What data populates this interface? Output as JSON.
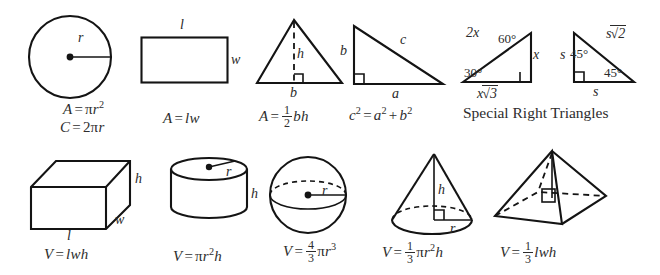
{
  "sheet": {
    "title": "Geometry Formula Reference",
    "row1": {
      "circle": {
        "name": "circle",
        "labels": {
          "radius": "r"
        },
        "formulas": {
          "area_lhs": "A",
          "area_eq": "=",
          "area_pi": "π",
          "area_var": "r",
          "area_exp": "2",
          "circ_lhs": "C",
          "circ_eq": "=",
          "circ_coef": "2",
          "circ_pi": "π",
          "circ_var": "r"
        },
        "area_text": "A = πr²",
        "circumference_text": "C = 2πr"
      },
      "rectangle": {
        "name": "rectangle",
        "labels": {
          "length": "l",
          "width": "w"
        },
        "formula_text": "A = lw",
        "formula": {
          "lhs": "A",
          "eq": "=",
          "rhs1": "l",
          "rhs2": "w"
        }
      },
      "triangle": {
        "name": "triangle",
        "labels": {
          "height": "h",
          "base": "b"
        },
        "formula_text": "A = 1/2 bh",
        "formula": {
          "lhs": "A",
          "eq": "=",
          "num": "1",
          "den": "2",
          "rhs1": "b",
          "rhs2": "h"
        }
      },
      "right_triangle": {
        "name": "right-triangle",
        "labels": {
          "leg_b": "b",
          "hypotenuse": "c",
          "leg_a": "a"
        },
        "formula_text": "c² = a² + b²",
        "formula": {
          "c": "c",
          "c_exp": "2",
          "eq": "=",
          "a": "a",
          "a_exp": "2",
          "plus": "+",
          "b": "b",
          "b_exp": "2"
        }
      },
      "special_right_triangles": {
        "name": "special-right-triangles",
        "caption": "Special Right Triangles",
        "t30_60_90": {
          "hypotenuse": "2x",
          "angle_60": "60°",
          "short_leg": "x",
          "angle_30": "30°",
          "long_leg_var": "x",
          "long_leg_radical": "√3",
          "long_leg_text": "x√3"
        },
        "t45_45_90": {
          "leg_left": "s",
          "angle_top": "45°",
          "hyp_var": "s",
          "hyp_radical": "√2",
          "hyp_text": "s√2",
          "angle_bottom": "45°",
          "leg_bottom": "s"
        }
      }
    },
    "row2": {
      "prism": {
        "name": "rectangular-prism",
        "labels": {
          "height": "h",
          "width": "w",
          "length": "l"
        },
        "formula_text": "V = lwh",
        "formula": {
          "lhs": "V",
          "eq": "=",
          "l": "l",
          "w": "w",
          "h": "h"
        }
      },
      "cylinder": {
        "name": "cylinder",
        "labels": {
          "radius": "r",
          "height": "h"
        },
        "formula_text": "V = πr²h",
        "formula": {
          "lhs": "V",
          "eq": "=",
          "pi": "π",
          "r": "r",
          "exp": "2",
          "h": "h"
        }
      },
      "sphere": {
        "name": "sphere",
        "labels": {
          "radius": "r"
        },
        "formula_text": "V = 4/3 πr³",
        "formula": {
          "lhs": "V",
          "eq": "=",
          "num": "4",
          "den": "3",
          "pi": "π",
          "r": "r",
          "exp": "3"
        }
      },
      "cone": {
        "name": "cone",
        "labels": {
          "height": "h",
          "radius": "r"
        },
        "formula_text": "V = 1/3 πr²h",
        "formula": {
          "lhs": "V",
          "eq": "=",
          "num": "1",
          "den": "3",
          "pi": "π",
          "r": "r",
          "exp": "2",
          "h": "h"
        }
      },
      "pyramid": {
        "name": "pyramid",
        "labels": {},
        "formula_text": "V = 1/3 lwh",
        "formula": {
          "lhs": "V",
          "eq": "=",
          "num": "1",
          "den": "3",
          "l": "l",
          "w": "w",
          "h": "h"
        }
      }
    }
  },
  "colors": {
    "ink": "#141414",
    "text": "#2d2d2d",
    "background": "#ffffff"
  }
}
